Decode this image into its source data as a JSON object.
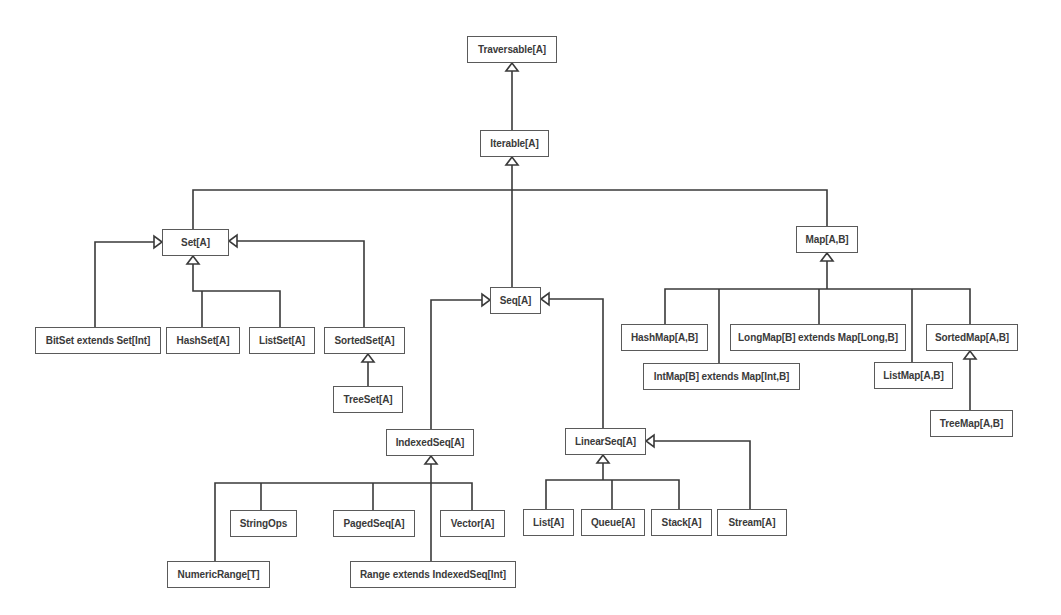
{
  "diagram": {
    "colors": {
      "line": "#3a3a3a",
      "box_border": "#5a5a5a",
      "text": "#3a3a3a",
      "background": "#ffffff"
    },
    "nodes": [
      {
        "id": "traversable",
        "label": "Traversable[A]",
        "x": 467,
        "y": 36,
        "w": 90,
        "h": 27
      },
      {
        "id": "iterable",
        "label": "Iterable[A]",
        "x": 480,
        "y": 130,
        "w": 69,
        "h": 27
      },
      {
        "id": "set",
        "label": "Set[A]",
        "x": 162,
        "y": 229,
        "w": 67,
        "h": 27
      },
      {
        "id": "map",
        "label": "Map[A,B]",
        "x": 796,
        "y": 226,
        "w": 62,
        "h": 27
      },
      {
        "id": "seq",
        "label": "Seq[A]",
        "x": 490,
        "y": 287,
        "w": 51,
        "h": 27
      },
      {
        "id": "bitset",
        "label": "BitSet extends Set[Int]",
        "x": 35,
        "y": 327,
        "w": 126,
        "h": 27
      },
      {
        "id": "hashset",
        "label": "HashSet[A]",
        "x": 166,
        "y": 327,
        "w": 74,
        "h": 27
      },
      {
        "id": "listset",
        "label": "ListSet[A]",
        "x": 249,
        "y": 327,
        "w": 66,
        "h": 27
      },
      {
        "id": "sortedset",
        "label": "SortedSet[A]",
        "x": 324,
        "y": 327,
        "w": 81,
        "h": 27
      },
      {
        "id": "treeset",
        "label": "TreeSet[A]",
        "x": 333,
        "y": 386,
        "w": 70,
        "h": 27
      },
      {
        "id": "hashmap",
        "label": "HashMap[A,B]",
        "x": 621,
        "y": 324,
        "w": 87,
        "h": 27
      },
      {
        "id": "longmap",
        "label": "LongMap[B] extends Map[Long,B]",
        "x": 730,
        "y": 324,
        "w": 176,
        "h": 27
      },
      {
        "id": "sortedmap",
        "label": "SortedMap[A,B]",
        "x": 926,
        "y": 324,
        "w": 92,
        "h": 27
      },
      {
        "id": "intmap",
        "label": "IntMap[B] extends Map[Int,B]",
        "x": 643,
        "y": 363,
        "w": 157,
        "h": 27
      },
      {
        "id": "listmap",
        "label": "ListMap[A,B]",
        "x": 874,
        "y": 362,
        "w": 79,
        "h": 27
      },
      {
        "id": "treemap",
        "label": "TreeMap[A,B]",
        "x": 930,
        "y": 410,
        "w": 83,
        "h": 27
      },
      {
        "id": "indexedseq",
        "label": "IndexedSeq[A]",
        "x": 386,
        "y": 429,
        "w": 88,
        "h": 27
      },
      {
        "id": "linearseq",
        "label": "LinearSeq[A]",
        "x": 565,
        "y": 428,
        "w": 81,
        "h": 27
      },
      {
        "id": "stringops",
        "label": "StringOps",
        "x": 230,
        "y": 510,
        "w": 67,
        "h": 27
      },
      {
        "id": "pagedseq",
        "label": "PagedSeq[A]",
        "x": 333,
        "y": 510,
        "w": 82,
        "h": 27
      },
      {
        "id": "vector",
        "label": "Vector[A]",
        "x": 440,
        "y": 510,
        "w": 65,
        "h": 27
      },
      {
        "id": "list",
        "label": "List[A]",
        "x": 523,
        "y": 509,
        "w": 51,
        "h": 27
      },
      {
        "id": "queue",
        "label": "Queue[A]",
        "x": 581,
        "y": 509,
        "w": 64,
        "h": 27
      },
      {
        "id": "stack",
        "label": "Stack[A]",
        "x": 651,
        "y": 509,
        "w": 61,
        "h": 27
      },
      {
        "id": "stream",
        "label": "Stream[A]",
        "x": 717,
        "y": 509,
        "w": 70,
        "h": 27
      },
      {
        "id": "numericrange",
        "label": "NumericRange[T]",
        "x": 167,
        "y": 561,
        "w": 103,
        "h": 27
      },
      {
        "id": "range",
        "label": "Range extends IndexedSeq[Int]",
        "x": 350,
        "y": 561,
        "w": 166,
        "h": 27
      }
    ],
    "lines": [
      {
        "points": [
          [
            512,
            130
          ],
          [
            512,
            70
          ]
        ]
      },
      {
        "points": [
          [
            512,
            287
          ],
          [
            512,
            164
          ]
        ]
      },
      {
        "points": [
          [
            193,
            229
          ],
          [
            193,
            190
          ],
          [
            827,
            190
          ],
          [
            827,
            226
          ]
        ]
      },
      {
        "points": [
          [
            95,
            327
          ],
          [
            95,
            242
          ],
          [
            154,
            242
          ]
        ]
      },
      {
        "points": [
          [
            364,
            327
          ],
          [
            364,
            241
          ],
          [
            237,
            241
          ]
        ]
      },
      {
        "points": [
          [
            193,
            264
          ],
          [
            193,
            291
          ],
          [
            280,
            291
          ],
          [
            280,
            327
          ]
        ]
      },
      {
        "points": [
          [
            202,
            291
          ],
          [
            202,
            327
          ]
        ]
      },
      {
        "points": [
          [
            368,
            386
          ],
          [
            368,
            362
          ]
        ]
      },
      {
        "points": [
          [
            827,
            261
          ],
          [
            827,
            289
          ]
        ]
      },
      {
        "points": [
          [
            665,
            324
          ],
          [
            665,
            289
          ],
          [
            970,
            289
          ],
          [
            970,
            324
          ]
        ]
      },
      {
        "points": [
          [
            719,
            289
          ],
          [
            719,
            363
          ]
        ]
      },
      {
        "points": [
          [
            819,
            289
          ],
          [
            819,
            324
          ]
        ]
      },
      {
        "points": [
          [
            912,
            289
          ],
          [
            912,
            362
          ]
        ]
      },
      {
        "points": [
          [
            970,
            410
          ],
          [
            970,
            358
          ]
        ]
      },
      {
        "points": [
          [
            431,
            429
          ],
          [
            431,
            300
          ],
          [
            482,
            300
          ]
        ]
      },
      {
        "points": [
          [
            603,
            428
          ],
          [
            603,
            299
          ],
          [
            549,
            299
          ]
        ]
      },
      {
        "points": [
          [
            431,
            464
          ],
          [
            431,
            561
          ]
        ]
      },
      {
        "points": [
          [
            215,
            561
          ],
          [
            215,
            483
          ],
          [
            472,
            483
          ],
          [
            472,
            510
          ]
        ]
      },
      {
        "points": [
          [
            261,
            483
          ],
          [
            261,
            510
          ]
        ]
      },
      {
        "points": [
          [
            373,
            483
          ],
          [
            373,
            510
          ]
        ]
      },
      {
        "points": [
          [
            603,
            463
          ],
          [
            603,
            480
          ]
        ]
      },
      {
        "points": [
          [
            546,
            509
          ],
          [
            546,
            480
          ],
          [
            679,
            480
          ],
          [
            679,
            509
          ]
        ]
      },
      {
        "points": [
          [
            612,
            480
          ],
          [
            612,
            509
          ]
        ]
      },
      {
        "points": [
          [
            750,
            509
          ],
          [
            750,
            441
          ],
          [
            654,
            441
          ]
        ]
      }
    ],
    "arrowheads": [
      {
        "target": "traversable",
        "x": 512,
        "y": 63,
        "dir": "up"
      },
      {
        "target": "iterable",
        "x": 512,
        "y": 157,
        "dir": "up"
      },
      {
        "target": "set",
        "x": 193,
        "y": 256,
        "dir": "up"
      },
      {
        "target": "set",
        "x": 162,
        "y": 242,
        "dir": "right"
      },
      {
        "target": "set",
        "x": 229,
        "y": 241,
        "dir": "left"
      },
      {
        "target": "sortedset",
        "x": 368,
        "y": 354,
        "dir": "up"
      },
      {
        "target": "map",
        "x": 827,
        "y": 253,
        "dir": "up"
      },
      {
        "target": "sortedmap",
        "x": 970,
        "y": 351,
        "dir": "up"
      },
      {
        "target": "seq",
        "x": 490,
        "y": 300,
        "dir": "right"
      },
      {
        "target": "seq",
        "x": 541,
        "y": 299,
        "dir": "left"
      },
      {
        "target": "indexedseq",
        "x": 431,
        "y": 456,
        "dir": "up"
      },
      {
        "target": "linearseq",
        "x": 603,
        "y": 455,
        "dir": "up"
      },
      {
        "target": "linearseq",
        "x": 646,
        "y": 441,
        "dir": "left"
      }
    ]
  }
}
